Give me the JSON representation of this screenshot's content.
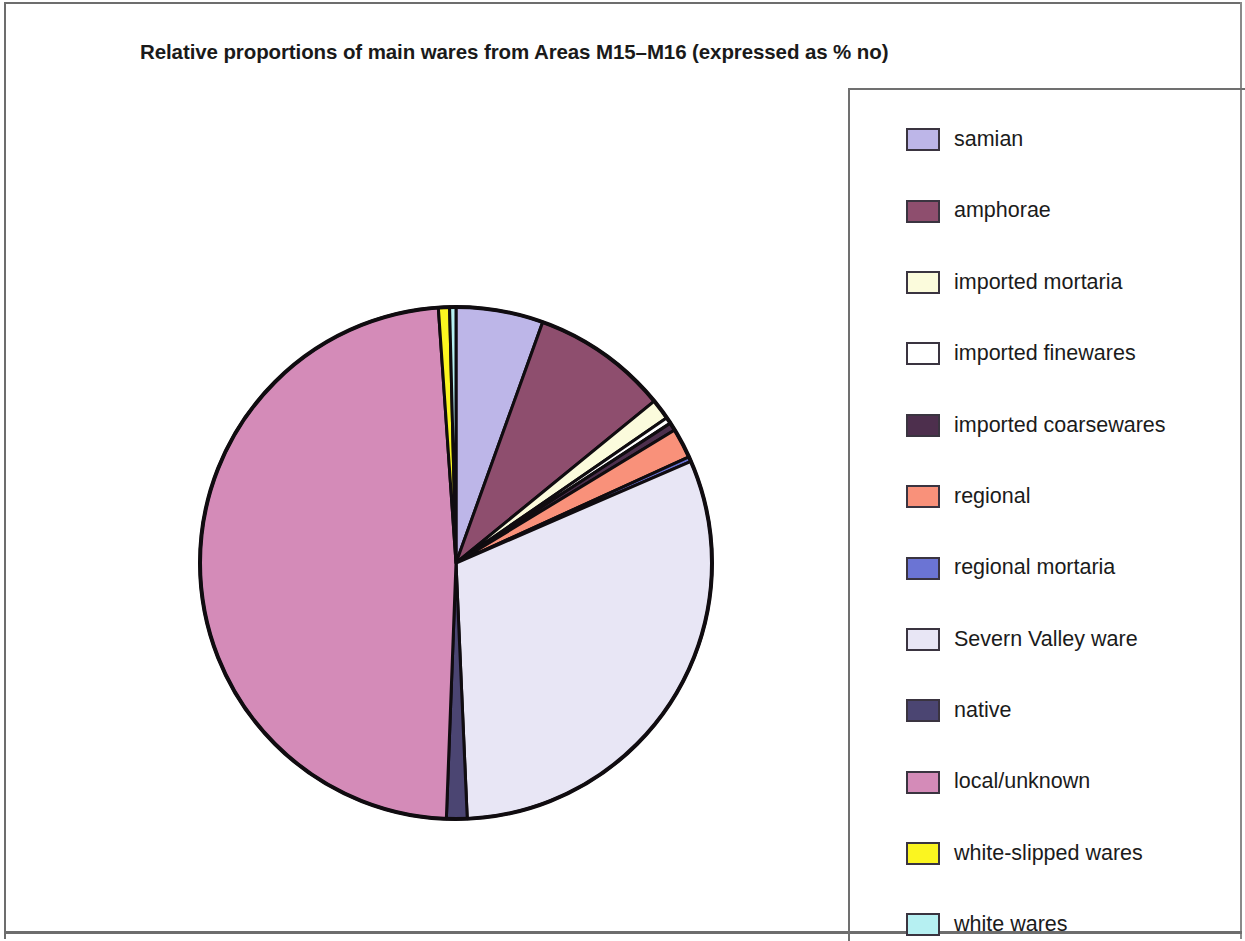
{
  "figure": {
    "title": "Relative proportions of main wares from Areas M15–M16 (expressed as % no)",
    "frame_color": "#6d6d6d",
    "background": "#ffffff"
  },
  "legend": {
    "position": "right",
    "border_color": "#707070",
    "items": [
      {
        "label": "samian",
        "color": "#BDB6E8"
      },
      {
        "label": "amphorae",
        "color": "#8E4E6E"
      },
      {
        "label": "imported mortaria",
        "color": "#FBFBDC"
      },
      {
        "label": "imported finewares",
        "color": "#FFFFFF"
      },
      {
        "label": "imported coarsewares",
        "color": "#4D2F4D"
      },
      {
        "label": "regional",
        "color": "#F9917A"
      },
      {
        "label": "regional mortaria",
        "color": "#6B74D4"
      },
      {
        "label": "Severn Valley ware",
        "color": "#E8E6F5"
      },
      {
        "label": "native",
        "color": "#4B4572"
      },
      {
        "label": "local/unknown",
        "color": "#D48BB8"
      },
      {
        "label": "white-slipped wares",
        "color": "#FBF520"
      },
      {
        "label": "white wares",
        "color": "#B6F0F2"
      }
    ]
  },
  "chart_data": {
    "type": "pie",
    "title": "Relative proportions of main wares from Areas M15–M16 (expressed as % no)",
    "unit": "% no",
    "start_angle_deg": 0,
    "direction": "clockwise",
    "center": {
      "x": 266,
      "y": 266
    },
    "radius": 256,
    "outline_color": "#100c10",
    "outline_width": 4,
    "legend_position": "right",
    "categories": [
      "samian",
      "amphorae",
      "imported mortaria",
      "imported finewares",
      "imported coarsewares",
      "regional",
      "regional mortaria",
      "Severn Valley ware",
      "native",
      "local/unknown",
      "white-slipped wares",
      "white wares"
    ],
    "values": [
      5.5,
      8.6,
      1.3,
      0.4,
      0.5,
      1.9,
      0.3,
      30.8,
      1.3,
      48.3,
      0.7,
      0.4
    ],
    "colors": [
      "#BDB6E8",
      "#8E4E6E",
      "#FBFBDC",
      "#FFFFFF",
      "#4D2F4D",
      "#F9917A",
      "#6B74D4",
      "#E8E6F5",
      "#4B4572",
      "#D48BB8",
      "#FBF520",
      "#B6F0F2"
    ]
  }
}
